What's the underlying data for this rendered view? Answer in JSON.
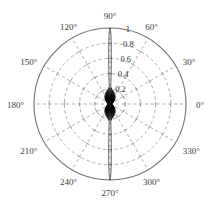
{
  "figure": {
    "background_color": "#ffffff",
    "grid_color": "#8d8d8d",
    "outline_color": "#6e6e6e",
    "data_color": "#000000",
    "center_x": 110,
    "center_y": 104,
    "radius": 76
  },
  "chart_data": {
    "type": "line",
    "subtype": "polar",
    "title": "",
    "xlabel": "",
    "ylabel": "",
    "grid": true,
    "legend_position": "none",
    "theta_unit": "degrees",
    "theta_direction": "counterclockwise",
    "theta_zero_location": "E",
    "rlim": [
      0,
      1
    ],
    "angle_tick_labels": [
      "0°",
      "30°",
      "60°",
      "90°",
      "120°",
      "150°",
      "180°",
      "210°",
      "240°",
      "270°",
      "300°",
      "330°"
    ],
    "angle_ticks": [
      0,
      30,
      60,
      90,
      120,
      150,
      180,
      210,
      240,
      270,
      300,
      330
    ],
    "radial_tick_labels": [
      "0.2",
      "0.4",
      "0.6",
      "0.8",
      "1"
    ],
    "radial_ticks": [
      0.2,
      0.4,
      0.6,
      0.8,
      1.0
    ],
    "radial_label_angle": 80,
    "series": [
      {
        "name": "pattern",
        "main_lobe_peaks_deg": [
          90,
          270
        ],
        "main_lobe_peak_value": 1.0,
        "main_lobe_half_width_deg": 3.2,
        "sidelobe_envelope_max": 0.22,
        "sidelobe_count": 58
      }
    ]
  },
  "labels": {
    "a0": "0°",
    "a30": "30°",
    "a60": "60°",
    "a90": "90°",
    "a120": "120°",
    "a150": "150°",
    "a180": "180°",
    "a210": "210°",
    "a240": "240°",
    "a270": "270°",
    "a300": "300°",
    "a330": "330°",
    "r02": "0.2",
    "r04": "0.4",
    "r06": "0.6",
    "r08": "0.8",
    "r10": "1"
  }
}
